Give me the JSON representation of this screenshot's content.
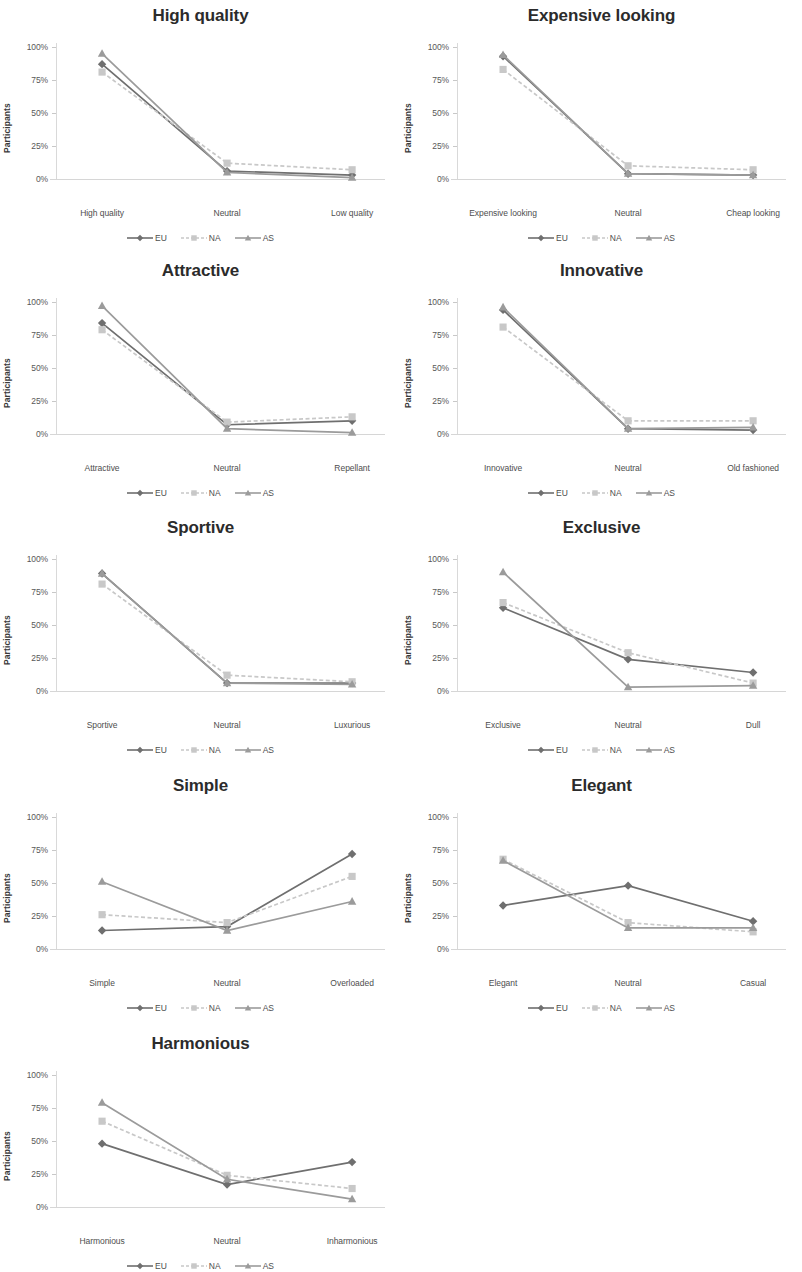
{
  "figure": {
    "series_names": [
      "EU",
      "NA",
      "AS"
    ],
    "series_colors": [
      "#6f6f6f",
      "#c8c8c8",
      "#9b9b9b"
    ],
    "series_markers": [
      "diamond",
      "square",
      "triangle"
    ],
    "y_axis_label": "Participants",
    "y_ticks": [
      "0%",
      "25%",
      "50%",
      "75%",
      "100%"
    ],
    "y_tick_values": [
      0,
      25,
      50,
      75,
      100
    ]
  },
  "chart_data": [
    {
      "type": "line",
      "title": "High quality",
      "categories": [
        "High quality",
        "Neutral",
        "Low quality"
      ],
      "series": [
        {
          "name": "EU",
          "values": [
            87,
            6,
            3
          ]
        },
        {
          "name": "NA",
          "values": [
            81,
            12,
            7
          ]
        },
        {
          "name": "AS",
          "values": [
            95,
            5,
            1
          ]
        }
      ],
      "xlabel": "",
      "ylabel": "Participants",
      "ylim": [
        0,
        100
      ],
      "grid": false,
      "legend": "bottom"
    },
    {
      "type": "line",
      "title": "Expensive looking",
      "categories": [
        "Expensive looking",
        "Neutral",
        "Cheap looking"
      ],
      "series": [
        {
          "name": "EU",
          "values": [
            93,
            4,
            3
          ]
        },
        {
          "name": "NA",
          "values": [
            83,
            10,
            7
          ]
        },
        {
          "name": "AS",
          "values": [
            94,
            4,
            3
          ]
        }
      ],
      "xlabel": "",
      "ylabel": "Participants",
      "ylim": [
        0,
        100
      ],
      "grid": false,
      "legend": "bottom"
    },
    {
      "type": "line",
      "title": "Attractive",
      "categories": [
        "Attractive",
        "Neutral",
        "Repellant"
      ],
      "series": [
        {
          "name": "EU",
          "values": [
            84,
            7,
            10
          ]
        },
        {
          "name": "NA",
          "values": [
            79,
            9,
            13
          ]
        },
        {
          "name": "AS",
          "values": [
            97,
            4,
            1
          ]
        }
      ],
      "xlabel": "",
      "ylabel": "Participants",
      "ylim": [
        0,
        100
      ],
      "grid": false,
      "legend": "bottom"
    },
    {
      "type": "line",
      "title": "Innovative",
      "categories": [
        "Innovative",
        "Neutral",
        "Old fashioned"
      ],
      "series": [
        {
          "name": "EU",
          "values": [
            94,
            4,
            3
          ]
        },
        {
          "name": "NA",
          "values": [
            81,
            10,
            10
          ]
        },
        {
          "name": "AS",
          "values": [
            96,
            4,
            5
          ]
        }
      ],
      "xlabel": "",
      "ylabel": "Participants",
      "ylim": [
        0,
        100
      ],
      "grid": false,
      "legend": "bottom"
    },
    {
      "type": "line",
      "title": "Sportive",
      "categories": [
        "Sportive",
        "Neutral",
        "Luxurious"
      ],
      "series": [
        {
          "name": "EU",
          "values": [
            89,
            6,
            6
          ]
        },
        {
          "name": "NA",
          "values": [
            81,
            12,
            7
          ]
        },
        {
          "name": "AS",
          "values": [
            89,
            6,
            5
          ]
        }
      ],
      "xlabel": "",
      "ylabel": "Participants",
      "ylim": [
        0,
        100
      ],
      "grid": false,
      "legend": "bottom"
    },
    {
      "type": "line",
      "title": "Exclusive",
      "categories": [
        "Exclusive",
        "Neutral",
        "Dull"
      ],
      "series": [
        {
          "name": "EU",
          "values": [
            63,
            24,
            14
          ]
        },
        {
          "name": "NA",
          "values": [
            67,
            29,
            6
          ]
        },
        {
          "name": "AS",
          "values": [
            90,
            3,
            4
          ]
        }
      ],
      "xlabel": "",
      "ylabel": "Participants",
      "ylim": [
        0,
        100
      ],
      "grid": false,
      "legend": "bottom"
    },
    {
      "type": "line",
      "title": "Simple",
      "categories": [
        "Simple",
        "Neutral",
        "Overloaded"
      ],
      "series": [
        {
          "name": "EU",
          "values": [
            14,
            17,
            72
          ]
        },
        {
          "name": "NA",
          "values": [
            26,
            20,
            55
          ]
        },
        {
          "name": "AS",
          "values": [
            51,
            14,
            36
          ]
        }
      ],
      "xlabel": "",
      "ylabel": "Participants",
      "ylim": [
        0,
        100
      ],
      "grid": false,
      "legend": "bottom"
    },
    {
      "type": "line",
      "title": "Elegant",
      "categories": [
        "Elegant",
        "Neutral",
        "Casual"
      ],
      "series": [
        {
          "name": "EU",
          "values": [
            33,
            48,
            21
          ]
        },
        {
          "name": "NA",
          "values": [
            68,
            20,
            13
          ]
        },
        {
          "name": "AS",
          "values": [
            67,
            16,
            16
          ]
        }
      ],
      "xlabel": "",
      "ylabel": "Participants",
      "ylim": [
        0,
        100
      ],
      "grid": false,
      "legend": "bottom"
    },
    {
      "type": "line",
      "title": "Harmonious",
      "categories": [
        "Harmonious",
        "Neutral",
        "Inharmonious"
      ],
      "series": [
        {
          "name": "EU",
          "values": [
            48,
            17,
            34
          ]
        },
        {
          "name": "NA",
          "values": [
            65,
            24,
            14
          ]
        },
        {
          "name": "AS",
          "values": [
            79,
            21,
            6
          ]
        }
      ],
      "xlabel": "",
      "ylabel": "Participants",
      "ylim": [
        0,
        100
      ],
      "grid": false,
      "legend": "bottom"
    }
  ]
}
